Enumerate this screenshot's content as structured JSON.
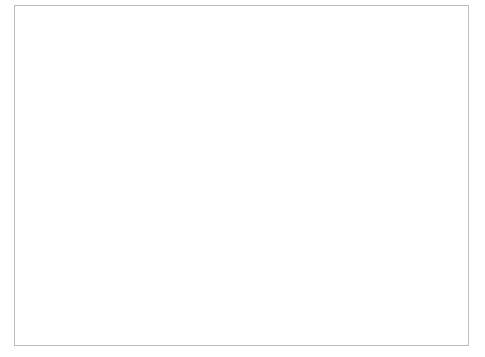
{
  "chart_data": {
    "type": "bar",
    "title": "",
    "subtitle": "",
    "xlabel": "",
    "ylabel": "",
    "y2label": "",
    "xlim": [
      1880,
      1940
    ],
    "ylim": [
      0,
      100
    ],
    "y2lim": [
      0,
      20
    ],
    "grid": true,
    "grid_axis": "y",
    "legend_position": "bottom",
    "x_ticks": [
      1880,
      1890,
      1900,
      1910,
      1920,
      1930,
      1940
    ],
    "x_tick_labels": [
      "1880",
      "1890",
      "1900",
      "1910",
      "1920",
      "1930",
      "1940"
    ],
    "x_minor_tick_interval": 2,
    "y_ticks": [
      0,
      25,
      50,
      75,
      100
    ],
    "y_tick_labels": [
      "0",
      "25",
      "50",
      "75",
      "100"
    ],
    "y2_ticks": [
      0,
      5,
      10,
      15,
      20
    ],
    "y2_tick_labels": [
      "0",
      "5",
      "10",
      "15",
      "20"
    ],
    "series": [
      {
        "name": "Total",
        "label": "Total",
        "type": "area",
        "axis": "left",
        "color": "#c9c9c9",
        "edge_color": "#9a9a9a",
        "x": [
          1880,
          1881,
          1882,
          1883,
          1884,
          1885,
          1886,
          1887,
          1888,
          1889,
          1890,
          1891,
          1892,
          1893,
          1894,
          1895,
          1896,
          1897,
          1898,
          1899,
          1900,
          1901,
          1902,
          1903,
          1904,
          1905,
          1906,
          1907,
          1908,
          1909,
          1910,
          1911,
          1912,
          1913,
          1914,
          1915,
          1916,
          1917,
          1918,
          1919,
          1920,
          1921,
          1922,
          1923,
          1924,
          1925,
          1926,
          1927,
          1928,
          1929,
          1930,
          1931,
          1932,
          1933,
          1934,
          1935,
          1936,
          1937,
          1938,
          1939,
          1940
        ],
        "values": [
          0,
          0,
          0,
          1,
          1,
          1,
          1,
          2,
          2,
          2,
          2,
          2,
          2,
          2,
          2,
          2,
          2,
          2,
          2,
          3,
          6,
          8,
          10,
          10,
          11,
          11,
          11,
          12,
          13,
          14,
          15,
          16,
          17,
          18,
          19,
          19,
          19,
          19,
          20,
          20,
          20,
          20,
          20,
          22,
          27,
          30,
          33,
          48,
          57,
          66,
          73,
          79,
          82,
          82,
          83,
          84,
          86,
          87,
          87,
          86,
          86
        ]
      },
      {
        "name": "Per year",
        "label": "Per year",
        "type": "bar",
        "axis": "right",
        "color": "#111111",
        "x": [
          1880,
          1881,
          1882,
          1883,
          1884,
          1885,
          1886,
          1887,
          1888,
          1889,
          1890,
          1891,
          1892,
          1893,
          1894,
          1895,
          1896,
          1897,
          1898,
          1899,
          1900,
          1901,
          1902,
          1903,
          1904,
          1905,
          1906,
          1907,
          1908,
          1909,
          1910,
          1911,
          1912,
          1913,
          1914,
          1915,
          1916,
          1917,
          1918,
          1919,
          1920,
          1921,
          1922,
          1923,
          1924,
          1925,
          1926,
          1927,
          1928,
          1929,
          1930,
          1931,
          1932,
          1933,
          1934,
          1935,
          1936,
          1937,
          1938,
          1939,
          1940
        ],
        "values": [
          0,
          0,
          0,
          1,
          0,
          0,
          0,
          1,
          0,
          0,
          0,
          0,
          0,
          0,
          0,
          0,
          0,
          0,
          0,
          1,
          3,
          2,
          0,
          1,
          0,
          0,
          1,
          1,
          2,
          0,
          3,
          1,
          0,
          1,
          0,
          0,
          0,
          0,
          1,
          0,
          0,
          0,
          2,
          4,
          5,
          3,
          3,
          15,
          9,
          9,
          7,
          3,
          4,
          0,
          2,
          2,
          1,
          1,
          0,
          0,
          0
        ]
      }
    ],
    "bar_value_callouts": [
      {
        "year": 1927,
        "value": 15
      },
      {
        "year": 1928,
        "value": 9
      },
      {
        "year": 1929,
        "value": 9
      },
      {
        "year": 1930,
        "value": 7
      },
      {
        "year": 1924,
        "value": 5
      }
    ]
  },
  "legend": {
    "items": [
      {
        "label": "Total",
        "swatch": "#c9c9c9",
        "swatch_border": "#9a9a9a"
      },
      {
        "label": "Per year",
        "swatch": "#111111",
        "swatch_border": "#111111"
      }
    ]
  },
  "colors": {
    "area_fill": "#c9c9c9",
    "area_edge": "#9a9a9a",
    "bar_fill": "#111111",
    "axis": "#7d7d7d",
    "grid": "#8f8f8f",
    "frame": "#bdbdbd",
    "background": "#ffffff",
    "text": "#111111"
  }
}
